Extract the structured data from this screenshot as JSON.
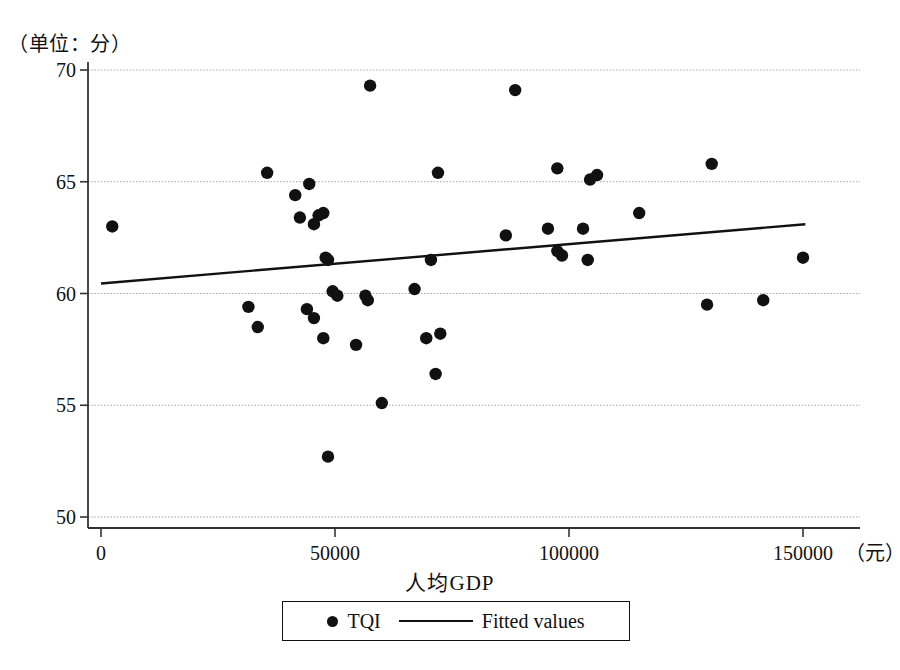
{
  "chart_data": {
    "type": "scatter",
    "title": "",
    "unit_note": "（单位：分）",
    "xlabel": "人均GDP",
    "x_unit": "（元）",
    "ylabel": "",
    "xlim": [
      0,
      155000
    ],
    "ylim": [
      49.5,
      70.5
    ],
    "xticks": [
      0,
      50000,
      100000,
      150000
    ],
    "xticklabels": [
      "0",
      "50000",
      "100000",
      "150000"
    ],
    "yticks": [
      50,
      55,
      60,
      65,
      70
    ],
    "yticklabels": [
      "50",
      "55",
      "60",
      "65",
      "70"
    ],
    "grid": "horizontal",
    "legend_position": "below-axis-centered",
    "series": [
      {
        "name": "TQI",
        "type": "scatter",
        "marker": "filled-circle",
        "color": "#111111",
        "points": [
          {
            "x": 2400,
            "y": 63.0
          },
          {
            "x": 31500,
            "y": 59.4
          },
          {
            "x": 33500,
            "y": 58.5
          },
          {
            "x": 35500,
            "y": 65.4
          },
          {
            "x": 41500,
            "y": 64.4
          },
          {
            "x": 42500,
            "y": 63.4
          },
          {
            "x": 44000,
            "y": 59.3
          },
          {
            "x": 44500,
            "y": 64.9
          },
          {
            "x": 45500,
            "y": 58.9
          },
          {
            "x": 45500,
            "y": 63.1
          },
          {
            "x": 46500,
            "y": 63.5
          },
          {
            "x": 47500,
            "y": 58.0
          },
          {
            "x": 47500,
            "y": 63.6
          },
          {
            "x": 48000,
            "y": 61.6
          },
          {
            "x": 48500,
            "y": 52.7
          },
          {
            "x": 48500,
            "y": 61.5
          },
          {
            "x": 49500,
            "y": 60.1
          },
          {
            "x": 50500,
            "y": 59.9
          },
          {
            "x": 54500,
            "y": 57.7
          },
          {
            "x": 56500,
            "y": 59.9
          },
          {
            "x": 57000,
            "y": 59.7
          },
          {
            "x": 57500,
            "y": 69.3
          },
          {
            "x": 60000,
            "y": 55.1
          },
          {
            "x": 67000,
            "y": 60.2
          },
          {
            "x": 69500,
            "y": 58.0
          },
          {
            "x": 70500,
            "y": 61.5
          },
          {
            "x": 71500,
            "y": 56.4
          },
          {
            "x": 72500,
            "y": 58.2
          },
          {
            "x": 72000,
            "y": 65.4
          },
          {
            "x": 86500,
            "y": 62.6
          },
          {
            "x": 88500,
            "y": 69.1
          },
          {
            "x": 95500,
            "y": 62.9
          },
          {
            "x": 97500,
            "y": 61.9
          },
          {
            "x": 98500,
            "y": 61.7
          },
          {
            "x": 97500,
            "y": 65.6
          },
          {
            "x": 103000,
            "y": 62.9
          },
          {
            "x": 104000,
            "y": 61.5
          },
          {
            "x": 104500,
            "y": 65.1
          },
          {
            "x": 106000,
            "y": 65.3
          },
          {
            "x": 115000,
            "y": 63.6
          },
          {
            "x": 129500,
            "y": 59.5
          },
          {
            "x": 130500,
            "y": 65.8
          },
          {
            "x": 141500,
            "y": 59.7
          },
          {
            "x": 150000,
            "y": 61.6
          }
        ]
      },
      {
        "name": "Fitted values",
        "type": "line",
        "color": "#111111",
        "endpoints": [
          {
            "x": 0,
            "y": 60.45
          },
          {
            "x": 150500,
            "y": 63.1
          }
        ]
      }
    ],
    "legend": [
      {
        "label": "TQI",
        "marker": "filled-circle"
      },
      {
        "label": "Fitted values",
        "marker": "line"
      }
    ]
  },
  "axes": {
    "unit_note": "（单位：分）",
    "x_axis_title": "人均GDP",
    "x_unit_label": "（元）"
  },
  "legend": {
    "scatter_label": "TQI",
    "fit_label": "Fitted values"
  },
  "icons": {
    "scatter_marker": "filled-circle-icon",
    "fit_marker": "line-segment-icon"
  }
}
